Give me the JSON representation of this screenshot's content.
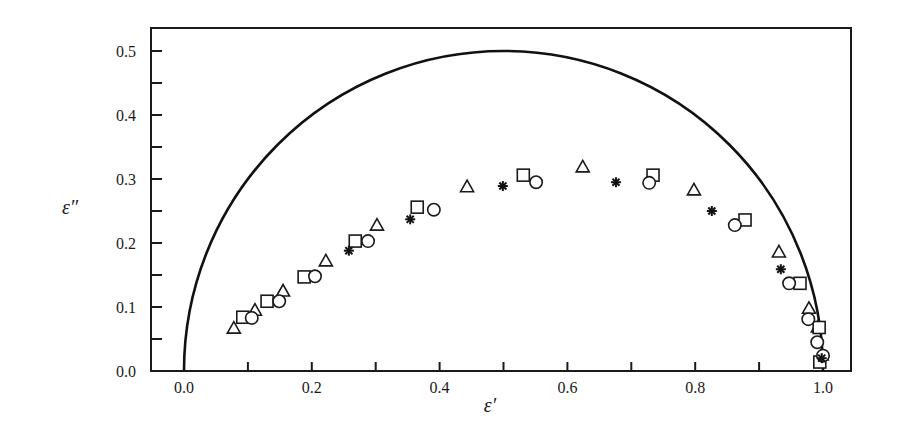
{
  "chart_data": {
    "type": "scatter",
    "title": "",
    "xlabel": "ε′",
    "ylabel": "ε″",
    "xlim": [
      -0.05,
      1.04
    ],
    "ylim": [
      0.0,
      0.53
    ],
    "grid": false,
    "x_ticks": [
      {
        "value": 0.0,
        "label": "0.0"
      },
      {
        "value": 0.1,
        "label": ""
      },
      {
        "value": 0.2,
        "label": "0.2"
      },
      {
        "value": 0.3,
        "label": ""
      },
      {
        "value": 0.4,
        "label": "0.4"
      },
      {
        "value": 0.5,
        "label": ""
      },
      {
        "value": 0.6,
        "label": "0.6"
      },
      {
        "value": 0.7,
        "label": ""
      },
      {
        "value": 0.8,
        "label": "0.8"
      },
      {
        "value": 0.9,
        "label": ""
      },
      {
        "value": 1.0,
        "label": "1.0"
      }
    ],
    "y_ticks": [
      {
        "value": 0.0,
        "label": "0.0"
      },
      {
        "value": 0.05,
        "label": ""
      },
      {
        "value": 0.1,
        "label": "0.1"
      },
      {
        "value": 0.15,
        "label": ""
      },
      {
        "value": 0.2,
        "label": "0.2"
      },
      {
        "value": 0.25,
        "label": ""
      },
      {
        "value": 0.3,
        "label": "0.3"
      },
      {
        "value": 0.35,
        "label": ""
      },
      {
        "value": 0.4,
        "label": "0.4"
      },
      {
        "value": 0.45,
        "label": ""
      },
      {
        "value": 0.5,
        "label": "0.5"
      }
    ],
    "curve": {
      "name": "Debye semicircle",
      "center": [
        0.5,
        0.0
      ],
      "radius": 0.5
    },
    "series": [
      {
        "name": "triangles",
        "marker": "triangle",
        "points": [
          [
            0.078,
            0.067
          ],
          [
            0.111,
            0.095
          ],
          [
            0.155,
            0.125
          ],
          [
            0.222,
            0.172
          ],
          [
            0.302,
            0.228
          ],
          [
            0.443,
            0.288
          ],
          [
            0.624,
            0.319
          ],
          [
            0.798,
            0.283
          ],
          [
            0.931,
            0.186
          ],
          [
            0.978,
            0.098
          ],
          [
            0.992,
            0.069
          ],
          [
            0.998,
            0.025
          ]
        ]
      },
      {
        "name": "squares",
        "marker": "square",
        "points": [
          [
            0.092,
            0.084
          ],
          [
            0.13,
            0.109
          ],
          [
            0.188,
            0.147
          ],
          [
            0.268,
            0.203
          ],
          [
            0.365,
            0.256
          ],
          [
            0.531,
            0.306
          ],
          [
            0.734,
            0.306
          ],
          [
            0.878,
            0.236
          ],
          [
            0.964,
            0.137
          ],
          [
            0.994,
            0.068
          ],
          [
            0.995,
            0.014
          ]
        ]
      },
      {
        "name": "circles",
        "marker": "circle",
        "points": [
          [
            0.106,
            0.083
          ],
          [
            0.149,
            0.109
          ],
          [
            0.205,
            0.148
          ],
          [
            0.288,
            0.203
          ],
          [
            0.391,
            0.252
          ],
          [
            0.551,
            0.295
          ],
          [
            0.728,
            0.294
          ],
          [
            0.862,
            0.228
          ],
          [
            0.947,
            0.137
          ],
          [
            0.977,
            0.081
          ],
          [
            0.991,
            0.045
          ],
          [
            1.0,
            0.024
          ]
        ]
      },
      {
        "name": "asterisks",
        "marker": "asterisk",
        "points": [
          [
            0.258,
            0.188
          ],
          [
            0.354,
            0.237
          ],
          [
            0.499,
            0.289
          ],
          [
            0.676,
            0.295
          ],
          [
            0.826,
            0.25
          ],
          [
            0.934,
            0.159
          ],
          [
            0.998,
            0.02
          ]
        ]
      }
    ]
  }
}
